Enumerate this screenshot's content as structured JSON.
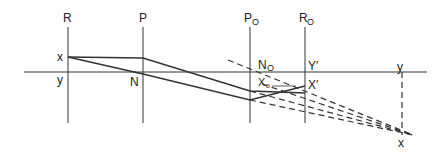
{
  "diagram": {
    "labels": {
      "R": "R",
      "P": "P",
      "P_O": "P",
      "P_O_sub": "O",
      "R_O": "R",
      "R_O_sub": "O",
      "x_left": "x",
      "y_left": "y",
      "N": "N",
      "N_O": "N",
      "N_O_sub": "O",
      "X_O": "X",
      "X_O_sub": "o",
      "Y_prime": "Y′",
      "X_prime": "X′",
      "y_right": "y",
      "x_right": "x"
    },
    "colors": {
      "stroke": "#333333",
      "text": "#222222"
    }
  }
}
